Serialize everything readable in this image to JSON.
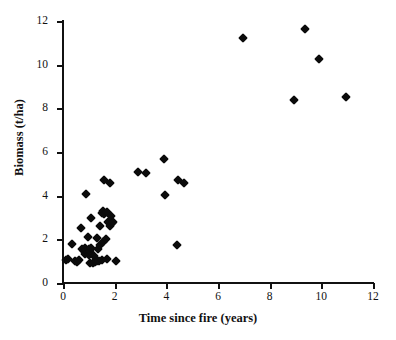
{
  "chart_data": {
    "type": "scatter",
    "title": "",
    "xlabel": "Time since fire (years)",
    "ylabel": "Biomass (t/ha)",
    "xlim": [
      0,
      12
    ],
    "ylim": [
      0,
      12
    ],
    "xticks": [
      0,
      2,
      4,
      6,
      8,
      10,
      12
    ],
    "yticks": [
      0,
      2,
      4,
      6,
      8,
      10,
      12
    ],
    "xtick_labels": [
      "0",
      "2",
      "4",
      "6",
      "8",
      "10",
      "12"
    ],
    "ytick_labels": [
      "0",
      "2",
      "4",
      "6",
      "8",
      "10",
      "12"
    ],
    "grid": false,
    "legend": null,
    "marker": "diamond",
    "marker_color": "#0b0b0b",
    "n_points": 54,
    "points": [
      {
        "x": 0.1,
        "y": 1.05
      },
      {
        "x": 0.2,
        "y": 1.1
      },
      {
        "x": 0.35,
        "y": 1.8
      },
      {
        "x": 0.45,
        "y": 1.0
      },
      {
        "x": 0.55,
        "y": 0.95
      },
      {
        "x": 0.6,
        "y": 1.05
      },
      {
        "x": 0.7,
        "y": 2.5
      },
      {
        "x": 0.75,
        "y": 1.55
      },
      {
        "x": 0.8,
        "y": 1.45
      },
      {
        "x": 0.85,
        "y": 1.35
      },
      {
        "x": 0.85,
        "y": 1.6
      },
      {
        "x": 0.9,
        "y": 4.08
      },
      {
        "x": 0.9,
        "y": 1.5
      },
      {
        "x": 0.95,
        "y": 2.1
      },
      {
        "x": 0.95,
        "y": 1.4
      },
      {
        "x": 1.0,
        "y": 1.55
      },
      {
        "x": 1.0,
        "y": 1.3
      },
      {
        "x": 1.05,
        "y": 1.45
      },
      {
        "x": 1.05,
        "y": 0.9
      },
      {
        "x": 1.1,
        "y": 3.0
      },
      {
        "x": 1.1,
        "y": 1.6
      },
      {
        "x": 1.15,
        "y": 0.9
      },
      {
        "x": 1.2,
        "y": 1.25
      },
      {
        "x": 1.25,
        "y": 0.95
      },
      {
        "x": 1.3,
        "y": 2.05
      },
      {
        "x": 1.3,
        "y": 1.0
      },
      {
        "x": 1.35,
        "y": 1.55
      },
      {
        "x": 1.4,
        "y": 1.0
      },
      {
        "x": 1.45,
        "y": 2.6
      },
      {
        "x": 1.45,
        "y": 1.75
      },
      {
        "x": 1.5,
        "y": 1.05
      },
      {
        "x": 1.5,
        "y": 3.2
      },
      {
        "x": 1.55,
        "y": 3.3
      },
      {
        "x": 1.55,
        "y": 1.9
      },
      {
        "x": 1.6,
        "y": 4.72
      },
      {
        "x": 1.6,
        "y": 3.15
      },
      {
        "x": 1.65,
        "y": 2.0
      },
      {
        "x": 1.7,
        "y": 3.25
      },
      {
        "x": 1.7,
        "y": 1.1
      },
      {
        "x": 1.75,
        "y": 2.8
      },
      {
        "x": 1.8,
        "y": 4.6
      },
      {
        "x": 1.8,
        "y": 2.6
      },
      {
        "x": 1.85,
        "y": 3.05
      },
      {
        "x": 1.9,
        "y": 2.75
      },
      {
        "x": 1.95,
        "y": 2.8
      },
      {
        "x": 2.05,
        "y": 1.0
      },
      {
        "x": 2.9,
        "y": 5.1
      },
      {
        "x": 3.2,
        "y": 5.05
      },
      {
        "x": 3.9,
        "y": 5.7
      },
      {
        "x": 3.95,
        "y": 4.05
      },
      {
        "x": 4.4,
        "y": 1.75
      },
      {
        "x": 4.45,
        "y": 4.7
      },
      {
        "x": 4.7,
        "y": 4.6
      },
      {
        "x": 6.95,
        "y": 11.2
      },
      {
        "x": 8.95,
        "y": 8.4
      },
      {
        "x": 9.35,
        "y": 11.65
      },
      {
        "x": 9.9,
        "y": 10.25
      },
      {
        "x": 10.95,
        "y": 8.5
      }
    ]
  }
}
